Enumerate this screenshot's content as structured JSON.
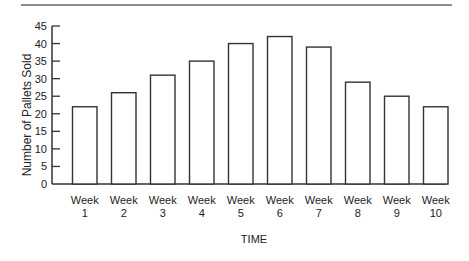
{
  "chart_data": {
    "type": "bar",
    "title": "",
    "xlabel": "TIME",
    "ylabel": "Number of Pallets Sold",
    "categories": [
      "Week 1",
      "Week 2",
      "Week 3",
      "Week 4",
      "Week 5",
      "Week 6",
      "Week 7",
      "Week 8",
      "Week 9",
      "Week 10"
    ],
    "category_lines": [
      [
        "Week",
        "1"
      ],
      [
        "Week",
        "2"
      ],
      [
        "Week",
        "3"
      ],
      [
        "Week",
        "4"
      ],
      [
        "Week",
        "5"
      ],
      [
        "Week",
        "6"
      ],
      [
        "Week",
        "7"
      ],
      [
        "Week",
        "8"
      ],
      [
        "Week",
        "9"
      ],
      [
        "Week",
        "10"
      ]
    ],
    "values": [
      22,
      26,
      31,
      35,
      40,
      42,
      39,
      29,
      25,
      22
    ],
    "ylim": [
      0,
      45
    ],
    "yticks": [
      0,
      5,
      10,
      15,
      20,
      25,
      30,
      35,
      40,
      45
    ],
    "grid": false,
    "legend": null,
    "bar_fill": "#ffffff",
    "bar_stroke": "#333333",
    "axis_color": "#333333",
    "top_rule_color": "#666666"
  }
}
